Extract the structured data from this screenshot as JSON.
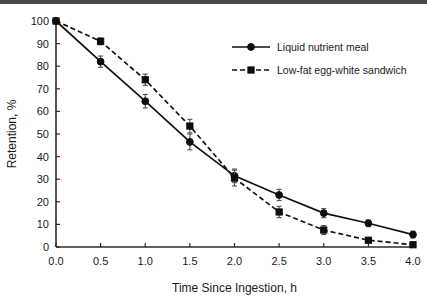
{
  "figure": {
    "scan_band_color": "#4a4a4a",
    "background": "#ffffff"
  },
  "chart_data": {
    "type": "line",
    "title": "",
    "xlabel": "Time Since Ingestion, h",
    "ylabel": "Retention, %",
    "x": [
      0.0,
      0.5,
      1.0,
      1.5,
      2.0,
      2.5,
      3.0,
      3.5,
      4.0
    ],
    "xticklabels": [
      "0.0",
      "0.5",
      "1.0",
      "1.5",
      "2.0",
      "2.5",
      "3.0",
      "3.5",
      "4.0"
    ],
    "yticklabels": [
      "0",
      "10",
      "20",
      "30",
      "40",
      "50",
      "60",
      "70",
      "80",
      "90",
      "100"
    ],
    "yticks": [
      0,
      10,
      20,
      30,
      40,
      50,
      60,
      70,
      80,
      90,
      100
    ],
    "xlim": [
      0.0,
      4.0
    ],
    "ylim": [
      0,
      100
    ],
    "grid": false,
    "legend_position": "upper right",
    "series": [
      {
        "name": "Liquid nutrient meal",
        "marker": "circle",
        "linestyle": "solid",
        "color": "#111111",
        "values": [
          100,
          82,
          64.5,
          46.5,
          31.5,
          23,
          15,
          10.5,
          5.5
        ],
        "errors": [
          0,
          2.5,
          3.0,
          3.5,
          3.0,
          2.5,
          2.0,
          1.5,
          1.5
        ]
      },
      {
        "name": "Low-fat egg-white sandwich",
        "marker": "square",
        "linestyle": "dashed",
        "color": "#111111",
        "values": [
          100,
          91,
          74,
          53.5,
          30.5,
          15.5,
          7.5,
          3.0,
          1.0
        ],
        "errors": [
          0,
          1.5,
          2.5,
          3.0,
          3.5,
          2.5,
          2.0,
          1.0,
          1.0
        ]
      }
    ]
  },
  "legend": {
    "entries": [
      {
        "label": "Liquid nutrient meal"
      },
      {
        "label": "Low-fat egg-white sandwich"
      }
    ]
  }
}
